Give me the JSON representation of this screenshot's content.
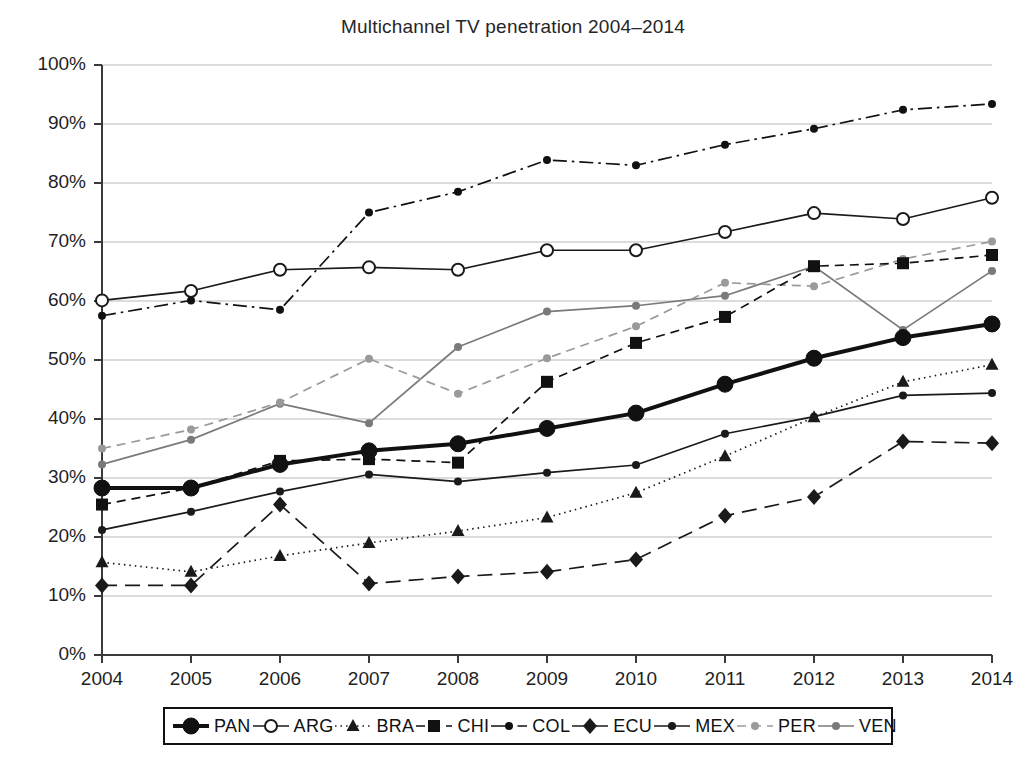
{
  "chart_data": {
    "type": "line",
    "title": "Multichannel TV penetration 2004–2014",
    "xlabel": "",
    "ylabel": "",
    "ylim": [
      0,
      100
    ],
    "yticks": [
      "0%",
      "10%",
      "20%",
      "30%",
      "40%",
      "50%",
      "60%",
      "70%",
      "80%",
      "90%",
      "100%"
    ],
    "ytick_values": [
      0,
      10,
      20,
      30,
      40,
      50,
      60,
      70,
      80,
      90,
      100
    ],
    "grid": "horizontal",
    "legend_position": "bottom",
    "categories": [
      "2004",
      "2005",
      "2006",
      "2007",
      "2008",
      "2009",
      "2010",
      "2011",
      "2012",
      "2013",
      "2014"
    ],
    "x": [
      2004,
      2005,
      2006,
      2007,
      2008,
      2009,
      2010,
      2011,
      2012,
      2013,
      2014
    ],
    "series": [
      {
        "name": "PAN",
        "marker": "circle-filled-large",
        "line": "solid-thick",
        "color": "#111111",
        "values": [
          28.3,
          28.3,
          32.3,
          34.6,
          35.8,
          38.4,
          41.0,
          45.9,
          50.3,
          53.8,
          56.1
        ]
      },
      {
        "name": "ARG",
        "marker": "circle-open",
        "line": "solid",
        "color": "#1a1a1a",
        "values": [
          60.1,
          61.7,
          65.3,
          65.7,
          65.3,
          68.6,
          68.6,
          71.7,
          74.9,
          73.9,
          77.5
        ]
      },
      {
        "name": "BRA",
        "marker": "triangle-filled",
        "line": "dotted",
        "color": "#1a1a1a",
        "values": [
          15.7,
          14.1,
          16.8,
          19.0,
          21.0,
          23.3,
          27.5,
          33.7,
          40.3,
          46.3,
          49.2
        ]
      },
      {
        "name": "CHI",
        "marker": "square-filled",
        "line": "dashed",
        "color": "#111111",
        "values": [
          25.5,
          28.3,
          32.9,
          33.2,
          32.6,
          46.3,
          52.9,
          57.3,
          65.9,
          66.4,
          67.8
        ]
      },
      {
        "name": "COL",
        "marker": "circle-small-filled",
        "line": "dash-dot",
        "color": "#111111",
        "values": [
          57.5,
          60.1,
          58.5,
          75.0,
          78.5,
          83.9,
          83.0,
          86.5,
          89.2,
          92.4,
          93.4
        ]
      },
      {
        "name": "ECU",
        "marker": "diamond-filled",
        "line": "long-dash",
        "color": "#1a1a1a",
        "values": [
          11.8,
          11.8,
          25.5,
          12.1,
          13.3,
          14.1,
          16.2,
          23.6,
          26.8,
          36.2,
          35.9
        ]
      },
      {
        "name": "MEX",
        "marker": "circle-small-filled",
        "line": "solid",
        "color": "#1a1a1a",
        "values": [
          21.2,
          24.3,
          27.7,
          30.6,
          29.4,
          30.9,
          32.2,
          37.5,
          40.4,
          44.0,
          44.4
        ]
      },
      {
        "name": "PER",
        "marker": "circle-small-filled",
        "line": "dashed",
        "color": "#9a9a9a",
        "values": [
          35.0,
          38.2,
          42.8,
          50.2,
          44.3,
          50.3,
          55.7,
          63.1,
          62.5,
          67.1,
          70.1
        ]
      },
      {
        "name": "VEN",
        "marker": "circle-small-filled",
        "line": "solid",
        "color": "#7a7a7a",
        "values": [
          32.3,
          36.5,
          42.6,
          39.3,
          52.2,
          58.2,
          59.2,
          60.9,
          65.9,
          55.1,
          65.1
        ]
      }
    ]
  },
  "legend": {
    "items": [
      {
        "label": "PAN"
      },
      {
        "label": "ARG"
      },
      {
        "label": "BRA"
      },
      {
        "label": "CHI"
      },
      {
        "label": "COL"
      },
      {
        "label": "ECU"
      },
      {
        "label": "MEX"
      },
      {
        "label": "PER"
      },
      {
        "label": "VEN"
      }
    ]
  }
}
